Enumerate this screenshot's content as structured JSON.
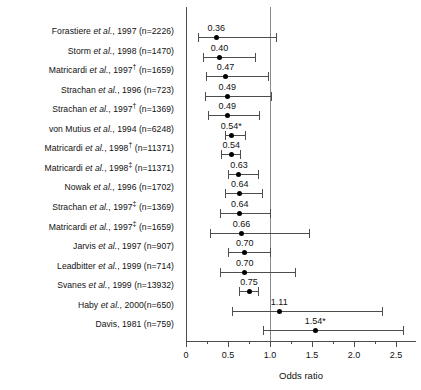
{
  "chart_data": {
    "type": "scatter",
    "title": "",
    "xlabel": "Odds ratio",
    "ylabel": "",
    "xlim": [
      0,
      2.6
    ],
    "reference_line": 1.0,
    "grid": false,
    "legend": null,
    "x_ticks_major": [
      0,
      0.5,
      1.0,
      1.5,
      2.0,
      2.5
    ],
    "x_tick_labels": [
      "0",
      "0.5",
      "1.0",
      "1.5",
      "2.0",
      "2.5"
    ],
    "x_ticks_minor": [
      0.25,
      0.75,
      1.25,
      1.75,
      2.25
    ],
    "categories": [
      "Forastiere et al., 1997 (n=2226)",
      "Storm et al., 1998 (n=1470)",
      "Matricardi et al., 1997† (n=1659)",
      "Strachan et al., 1996 (n=723)",
      "Strachan et al., 1997† (n=1369)",
      "von Mutius et al., 1994 (n=6248)",
      "Matricardi et al., 1998† (n=11371)",
      "Matricardi et al., 1998‡ (n=11371)",
      "Nowak et al., 1996 (n=1702)",
      "Strachan et al., 1997‡ (n=1369)",
      "Matricardi et al., 1997‡ (n=1659)",
      "Jarvis et al., 1997 (n=907)",
      "Leadbitter et al., 1999 (n=714)",
      "Svanes et al., 1999 (n=13932)",
      "Haby et al., 2000(n=650)",
      "Davis, 1981 (n=759)"
    ],
    "values": [
      0.36,
      0.4,
      0.47,
      0.49,
      0.49,
      0.54,
      0.54,
      0.63,
      0.64,
      0.64,
      0.66,
      0.7,
      0.7,
      0.75,
      1.11,
      1.54
    ],
    "ci_low": [
      0.14,
      0.2,
      0.24,
      0.23,
      0.26,
      0.47,
      0.42,
      0.5,
      0.46,
      0.4,
      0.29,
      0.5,
      0.4,
      0.63,
      0.55,
      0.92
    ],
    "ci_high": [
      1.07,
      0.82,
      0.98,
      1.01,
      0.87,
      0.7,
      0.64,
      0.86,
      0.9,
      1.0,
      1.46,
      1.0,
      1.3,
      0.86,
      2.33,
      2.58
    ]
  },
  "rows": [
    {
      "author": "Forastiere ",
      "etal": "et al.",
      "rest": ", 1997 (n=2226)",
      "dagger": "",
      "value_label": "0.36",
      "value": 0.36,
      "ci_low": 0.14,
      "ci_high": 1.07
    },
    {
      "author": "Storm ",
      "etal": "et al.",
      "rest": ", 1998 (n=1470)",
      "dagger": "",
      "value_label": "0.40",
      "value": 0.4,
      "ci_low": 0.2,
      "ci_high": 0.82
    },
    {
      "author": "Matricardi ",
      "etal": "et al.",
      "rest": ", 1997",
      "dagger": "†",
      "rest2": " (n=1659)",
      "value_label": "0.47",
      "value": 0.47,
      "ci_low": 0.24,
      "ci_high": 0.98
    },
    {
      "author": "Strachan ",
      "etal": "et al.",
      "rest": ", 1996 (n=723)",
      "dagger": "",
      "value_label": "0.49",
      "value": 0.49,
      "ci_low": 0.23,
      "ci_high": 1.01
    },
    {
      "author": "Strachan ",
      "etal": "et al.",
      "rest": ", 1997",
      "dagger": "†",
      "rest2": " (n=1369)",
      "value_label": "0.49",
      "value": 0.49,
      "ci_low": 0.26,
      "ci_high": 0.87
    },
    {
      "author": "von Mutius ",
      "etal": "et al.",
      "rest": ", 1994 (n=6248)",
      "dagger": "",
      "value_label": "0.54*",
      "value": 0.54,
      "ci_low": 0.47,
      "ci_high": 0.7
    },
    {
      "author": "Matricardi ",
      "etal": "et al.",
      "rest": ", 1998",
      "dagger": "†",
      "rest2": " (n=11371)",
      "value_label": "0.54",
      "value": 0.54,
      "ci_low": 0.42,
      "ci_high": 0.64
    },
    {
      "author": "Matricardi ",
      "etal": "et al.",
      "rest": ", 1998",
      "dagger": "‡",
      "rest2": " (n=11371)",
      "value_label": "0.63",
      "value": 0.63,
      "ci_low": 0.5,
      "ci_high": 0.86
    },
    {
      "author": "Nowak ",
      "etal": "et al.",
      "rest": ", 1996 (n=1702)",
      "dagger": "",
      "value_label": "0.64",
      "value": 0.64,
      "ci_low": 0.46,
      "ci_high": 0.9
    },
    {
      "author": "Strachan ",
      "etal": "et al.",
      "rest": ", 1997",
      "dagger": "‡",
      "rest2": " (n=1369)",
      "value_label": "0.64",
      "value": 0.64,
      "ci_low": 0.4,
      "ci_high": 1.0
    },
    {
      "author": "Matricardi ",
      "etal": "et al.",
      "rest": ", 1997",
      "dagger": "‡",
      "rest2": " (n=1659)",
      "value_label": "0.66",
      "value": 0.66,
      "ci_low": 0.29,
      "ci_high": 1.46
    },
    {
      "author": "Jarvis ",
      "etal": "et al.",
      "rest": ", 1997 (n=907)",
      "dagger": "",
      "value_label": "0.70",
      "value": 0.7,
      "ci_low": 0.5,
      "ci_high": 1.0
    },
    {
      "author": "Leadbitter ",
      "etal": "et al.",
      "rest": ", 1999 (n=714)",
      "dagger": "",
      "value_label": "0.70",
      "value": 0.7,
      "ci_low": 0.4,
      "ci_high": 1.3
    },
    {
      "author": "Svanes ",
      "etal": "et al.",
      "rest": ", 1999 (n=13932)",
      "dagger": "",
      "value_label": "0.75",
      "value": 0.75,
      "ci_low": 0.63,
      "ci_high": 0.86
    },
    {
      "author": "Haby ",
      "etal": "et al.",
      "rest": ", 2000(n=650)",
      "dagger": "",
      "value_label": "1.11",
      "value": 1.11,
      "ci_low": 0.55,
      "ci_high": 2.33
    },
    {
      "author": "Davis, 1981 (n=759)",
      "etal": "",
      "rest": "",
      "dagger": "",
      "value_label": "1.54*",
      "value": 1.54,
      "ci_low": 0.92,
      "ci_high": 2.58
    }
  ],
  "axis": {
    "title": "Odds ratio",
    "tick_labels": [
      "0",
      "0.5",
      "1.0",
      "1.5",
      "2.0",
      "2.5"
    ],
    "tick_values": [
      0,
      0.5,
      1.0,
      1.5,
      2.0,
      2.5
    ],
    "minor_tick_values": [
      0.25,
      0.75,
      1.25,
      1.75,
      2.25
    ]
  },
  "colors": {
    "point": "#000000",
    "ci": "#4d4d4d",
    "reference": "#8a8a8a",
    "text": "#111111",
    "background": "#ffffff"
  }
}
